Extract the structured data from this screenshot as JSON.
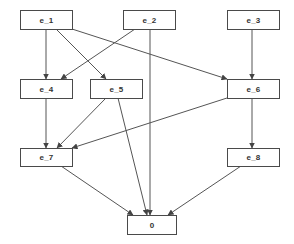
{
  "diagram": {
    "type": "directed-graph",
    "colors": {
      "node_border": "#4a4a4a",
      "edge": "#555555",
      "text": "#333333",
      "background": "#ffffff"
    },
    "nodes": [
      {
        "id": "e_1",
        "label": "e_1"
      },
      {
        "id": "e_2",
        "label": "e_2"
      },
      {
        "id": "e_3",
        "label": "e_3"
      },
      {
        "id": "e_4",
        "label": "e_4"
      },
      {
        "id": "e_5",
        "label": "e_5"
      },
      {
        "id": "e_6",
        "label": "e_6"
      },
      {
        "id": "e_7",
        "label": "e_7"
      },
      {
        "id": "e_8",
        "label": "e_8"
      },
      {
        "id": "0",
        "label": "0"
      }
    ],
    "edges": [
      {
        "from": "e_1",
        "to": "e_4"
      },
      {
        "from": "e_1",
        "to": "e_5"
      },
      {
        "from": "e_1",
        "to": "e_6"
      },
      {
        "from": "e_2",
        "to": "e_4"
      },
      {
        "from": "e_2",
        "to": "0"
      },
      {
        "from": "e_3",
        "to": "e_6"
      },
      {
        "from": "e_4",
        "to": "e_7"
      },
      {
        "from": "e_5",
        "to": "e_7"
      },
      {
        "from": "e_5",
        "to": "0"
      },
      {
        "from": "e_6",
        "to": "e_7"
      },
      {
        "from": "e_6",
        "to": "e_8"
      },
      {
        "from": "e_7",
        "to": "0"
      },
      {
        "from": "e_8",
        "to": "0"
      }
    ]
  }
}
